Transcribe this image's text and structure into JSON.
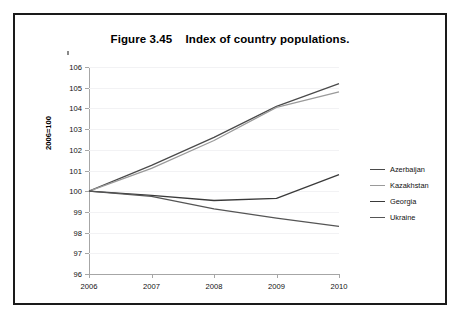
{
  "figure": {
    "title": "Figure 3.45    Index of country populations.",
    "border_color": "#1a1a1a",
    "background_color": "#ffffff"
  },
  "axes": {
    "y_title": "2006=100",
    "y_ticks": [
      "106",
      "105",
      "104",
      "103",
      "102",
      "101",
      "100",
      "99",
      "98",
      "97",
      "96"
    ],
    "x_ticks": [
      "2006",
      "2007",
      "2008",
      "2009",
      "2010"
    ]
  },
  "legend": {
    "items": [
      {
        "label": "Azerbaijan",
        "color": "#4a4a4a"
      },
      {
        "label": "Kazakhstan",
        "color": "#9a9a9a"
      },
      {
        "label": "Georgia",
        "color": "#3a3a3a"
      },
      {
        "label": "Ukraine",
        "color": "#555555"
      }
    ]
  },
  "chart_data": {
    "type": "line",
    "title": "Figure 3.45    Index of country populations.",
    "xlabel": "",
    "ylabel": "2006=100",
    "categories": [
      "2006",
      "2007",
      "2008",
      "2009",
      "2010"
    ],
    "x": [
      2006,
      2007,
      2008,
      2009,
      2010
    ],
    "ylim": [
      96,
      106
    ],
    "xlim": [
      2006,
      2010
    ],
    "ytick_step": 1,
    "grid": true,
    "legend_position": "right",
    "series": [
      {
        "name": "Azerbaijan",
        "color": "#4a4a4a",
        "values": [
          100.0,
          101.25,
          102.6,
          104.1,
          105.2
        ]
      },
      {
        "name": "Kazakhstan",
        "color": "#9a9a9a",
        "values": [
          100.0,
          101.1,
          102.45,
          104.05,
          104.8
        ]
      },
      {
        "name": "Georgia",
        "color": "#3a3a3a",
        "values": [
          100.0,
          99.8,
          99.55,
          99.65,
          100.8
        ]
      },
      {
        "name": "Ukraine",
        "color": "#555555",
        "values": [
          100.0,
          99.75,
          99.15,
          98.7,
          98.3
        ]
      }
    ]
  }
}
